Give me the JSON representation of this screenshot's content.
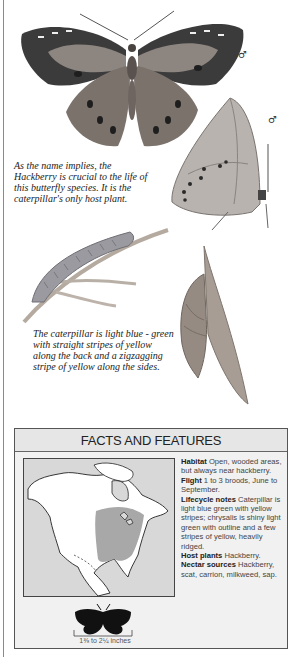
{
  "illustrations": {
    "adult_top_view": "butterfly-open-wings-illustration",
    "adult_side_view": "butterfly-closed-wings-illustration",
    "caterpillar": "caterpillar-on-stem-illustration",
    "chrysalis": "chrysalis-on-leaf-illustration"
  },
  "symbols": {
    "male_top": "♂",
    "male_side": "♂"
  },
  "captions": {
    "host_plant": "As the name implies, the\nHackberry is crucial to the life of\nthis butterfly species. It is the\ncaterpillar's only host plant.",
    "caterpillar": "The caterpillar is light blue - green\nwith straight stripes of yellow\nalong the back and a zigzagging\nstripe of yellow along the sides."
  },
  "facts": {
    "title": "FACTS AND FEATURES",
    "entries": [
      {
        "label": "Habitat",
        "text": "Open, wooded areas, but always near hackberry."
      },
      {
        "label": "Flight",
        "text": "1 to 3 broods, June to September."
      },
      {
        "label": "Lifecycle notes",
        "text": "Caterpillar is light blue green with yellow stripes; chrysalis is shiny light green with outline and a few stripes of yellow, heavily ridged."
      },
      {
        "label": "Host plants",
        "text": "Hackberry."
      },
      {
        "label": "Nectar sources",
        "text": "Hackberry, scat, carrion, milkweed, sap."
      }
    ],
    "map": {
      "name": "range-map-north-america",
      "range_color": "#a8a8a8",
      "land_color": "#ffffff",
      "water_color": "#d8d8d8"
    },
    "size": {
      "label": "1⅜ to 2¼ inches",
      "silhouette_color": "#111111"
    }
  }
}
